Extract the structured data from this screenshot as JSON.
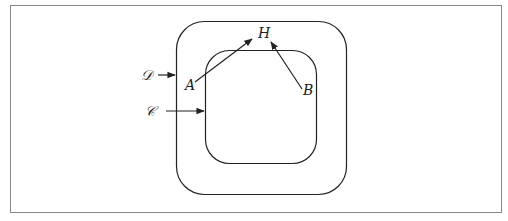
{
  "diagram": {
    "type": "nested-regions",
    "regions": [
      {
        "id": "D",
        "label": "D",
        "role": "outer rounded square"
      },
      {
        "id": "C",
        "label": "C",
        "role": "inner rounded square"
      }
    ],
    "points": [
      {
        "id": "A",
        "label": "A"
      },
      {
        "id": "B",
        "label": "B"
      },
      {
        "id": "H",
        "label": "H"
      }
    ],
    "arrows": [
      {
        "from": "D",
        "to": "outer boundary"
      },
      {
        "from": "C",
        "to": "inner boundary"
      },
      {
        "from": "A",
        "to": "H"
      },
      {
        "from": "B",
        "to": "H"
      }
    ],
    "colors": {
      "stroke": "#222222",
      "frame": "#888888",
      "background": "#ffffff"
    }
  },
  "labels": {
    "D": "𝒟",
    "C": "𝒞",
    "A": "A",
    "B": "B",
    "H": "H"
  }
}
